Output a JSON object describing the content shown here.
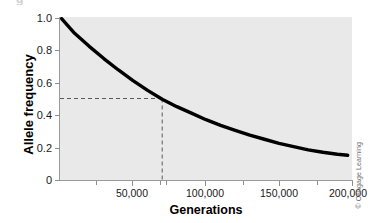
{
  "figure": {
    "clipped_glyph": "g",
    "credit": "© Cengage Learning"
  },
  "axes": {
    "y_title": "Allele frequency",
    "x_title": "Generations",
    "y_ticks": [
      "1.0",
      "0.8",
      "0.6",
      "0.4",
      "0.2",
      "0"
    ],
    "x_ticks": [
      "50,000",
      "100,000",
      "150,000",
      "200,000"
    ]
  },
  "colors": {
    "plot_background": "#e9e9e9",
    "page_background": "#ffffff",
    "curve": "#000000",
    "axis": "#9a9a9a",
    "tick": "#8e8e8e",
    "guide_dash": "#5a5a5a",
    "text": "#1a1a1a",
    "credit_text": "#6e6e6e"
  },
  "chart_data": {
    "type": "line",
    "title": "",
    "xlabel": "Generations",
    "ylabel": "Allele frequency",
    "xlim": [
      0,
      200000
    ],
    "ylim": [
      0,
      1.0
    ],
    "grid": false,
    "legend": "none",
    "x_tick_values": [
      50000,
      100000,
      150000,
      200000
    ],
    "x_minor_tick_values": [
      25000,
      70000,
      75000,
      125000,
      175000
    ],
    "y_tick_values": [
      1.0,
      0.8,
      0.6,
      0.4,
      0.2,
      0
    ],
    "series": [
      {
        "name": "Allele frequency over time",
        "x": [
          0,
          10000,
          20000,
          30000,
          40000,
          50000,
          60000,
          70000,
          80000,
          90000,
          100000,
          110000,
          120000,
          130000,
          140000,
          150000,
          160000,
          170000,
          180000,
          190000,
          197000
        ],
        "y": [
          0.99,
          0.9,
          0.82,
          0.745,
          0.675,
          0.61,
          0.55,
          0.495,
          0.45,
          0.41,
          0.37,
          0.335,
          0.305,
          0.275,
          0.25,
          0.225,
          0.205,
          0.185,
          0.17,
          0.158,
          0.152
        ]
      }
    ],
    "annotations": [
      {
        "type": "dashed-guide",
        "label": "horizontal guide at allele frequency 0.5",
        "from": [
          0,
          0.5
        ],
        "to": [
          70000,
          0.5
        ]
      },
      {
        "type": "dashed-guide",
        "label": "vertical guide at 70,000 generations",
        "from": [
          70000,
          0.5
        ],
        "to": [
          70000,
          0
        ]
      }
    ]
  }
}
